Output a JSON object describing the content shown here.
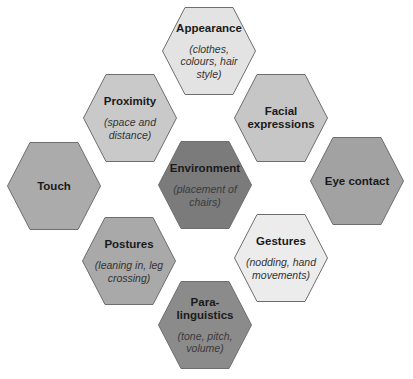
{
  "diagram": {
    "type": "hexagon-cluster",
    "nodes": [
      {
        "id": "appearance",
        "title": "Appearance",
        "subtitle": "(clothes, colours, hair style)",
        "fill": "#e3e3e3",
        "cx": 209,
        "cy": 51
      },
      {
        "id": "proximity",
        "title": "Proximity",
        "subtitle": "(space and distance)",
        "fill": "#c9c9c9",
        "cx": 130,
        "cy": 118
      },
      {
        "id": "facial-expressions",
        "title": "Facial expressions",
        "subtitle": "",
        "fill": "#c6c6c6",
        "cx": 281,
        "cy": 118
      },
      {
        "id": "touch",
        "title": "Touch",
        "subtitle": "",
        "fill": "#ababab",
        "cx": 54,
        "cy": 186
      },
      {
        "id": "environment",
        "title": "Environment",
        "subtitle": "(placement of chairs)",
        "fill": "#7b7b7b",
        "cx": 205,
        "cy": 185
      },
      {
        "id": "eye-contact",
        "title": "Eye contact",
        "subtitle": "",
        "fill": "#a2a2a2",
        "cx": 357,
        "cy": 181
      },
      {
        "id": "postures",
        "title": "Postures",
        "subtitle": "(leaning in, leg crossing)",
        "fill": "#a9a9a9",
        "cx": 129,
        "cy": 261
      },
      {
        "id": "gestures",
        "title": "Gestures",
        "subtitle": "(nodding, hand movements)",
        "fill": "#ececec",
        "cx": 281,
        "cy": 258
      },
      {
        "id": "paralinguistics",
        "title": "Para-\nlinguistics",
        "subtitle": "(tone, pitch, volume)",
        "fill": "#8b8b8b",
        "cx": 205,
        "cy": 325
      }
    ],
    "stroke": "#6e6e6e"
  }
}
